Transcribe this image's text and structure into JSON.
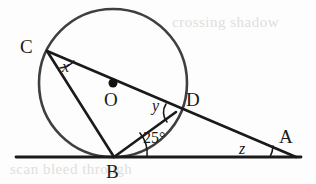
{
  "figure": {
    "width": 316,
    "height": 184,
    "background_color": "#fdfdfd",
    "stroke_color": "#1a1a1a",
    "circle_color": "#3a3a3a"
  },
  "points": {
    "C": {
      "label": "C",
      "x": 47,
      "y": 51,
      "label_x": 20,
      "label_y": 36
    },
    "O": {
      "label": "O",
      "x": 113,
      "y": 83,
      "label_x": 104,
      "label_y": 89
    },
    "D": {
      "label": "D",
      "x": 176,
      "y": 112,
      "label_x": 186,
      "label_y": 89
    },
    "A": {
      "label": "A",
      "x": 296,
      "y": 157,
      "label_x": 279,
      "label_y": 126
    },
    "B": {
      "label": "B",
      "x": 114,
      "y": 157,
      "label_x": 106,
      "label_y": 161
    }
  },
  "angles": {
    "x": {
      "label": "x",
      "vertex": "C",
      "label_x": 62,
      "label_y": 58,
      "description": "angle BCD at C"
    },
    "y": {
      "label": "y",
      "vertex": "D",
      "label_x": 152,
      "label_y": 97,
      "description": "angle BDO at D"
    },
    "twentyfive": {
      "label": "25°",
      "vertex": "B",
      "label_x": 143,
      "label_y": 129,
      "description": "angle DBA at B between tangent line and BD"
    },
    "z": {
      "label": "z",
      "vertex": "A",
      "label_x": 239,
      "label_y": 140,
      "description": "angle at A"
    }
  },
  "circle": {
    "center_x": 113,
    "center_y": 83,
    "radius": 74,
    "center_dot_radius": 4.5
  },
  "baseline": {
    "x1": 16,
    "y1": 157,
    "x2": 301,
    "y2": 157,
    "description": "tangent line through B"
  },
  "segments": [
    {
      "name": "C-to-A",
      "x1": 47,
      "y1": 51,
      "x2": 296,
      "y2": 157
    },
    {
      "name": "C-to-B",
      "x1": 47,
      "y1": 51,
      "x2": 114,
      "y2": 157
    },
    {
      "name": "B-to-D",
      "x1": 114,
      "y1": 157,
      "x2": 176,
      "y2": 112
    }
  ],
  "ghost_text": {
    "top": "crossing shadow",
    "bottom": "scan bleed through"
  }
}
